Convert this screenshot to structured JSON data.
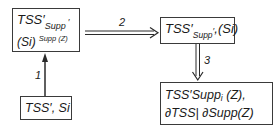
{
  "diagram": {
    "nodes": [
      {
        "id": "A",
        "line1_main": "TSS",
        "line1_prime": "′",
        "line1_sub": "Supp",
        "line1_subprime": "′",
        "line2_main": "(Si)",
        "line2_sup": "Supp (Z)"
      },
      {
        "id": "B",
        "main": "TSS",
        "prime": "′",
        "sub": "Supp",
        "subprime": "′",
        "tail": ",(Si)"
      },
      {
        "id": "C",
        "line1": "TSS′Supp",
        "line1_sub": "i",
        "line1_tail": " (Z),",
        "line2": "∂TSS| ∂Supp(Z)"
      },
      {
        "id": "D",
        "text": "TSS′, Si"
      }
    ],
    "edges": [
      {
        "from": "D",
        "to": "A",
        "label": "1",
        "style": "single"
      },
      {
        "from": "A",
        "to": "B",
        "label": "2",
        "style": "double"
      },
      {
        "from": "B",
        "to": "C",
        "label": "3",
        "style": "double"
      }
    ],
    "colors": {
      "stroke": "#3a3a3a",
      "text": "#1a1a1a",
      "background": "#ffffff"
    }
  }
}
